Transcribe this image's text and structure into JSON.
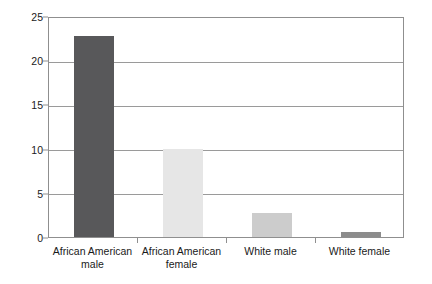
{
  "chart_data": {
    "type": "bar",
    "title": "",
    "subtitle": "",
    "xlabel": "",
    "ylabel": "",
    "categories": [
      "African American male",
      "African American female",
      "White male",
      "White female"
    ],
    "category_lines": [
      [
        "African American",
        "male"
      ],
      [
        "African American",
        "female"
      ],
      [
        "White male",
        ""
      ],
      [
        "White female",
        ""
      ]
    ],
    "values": [
      22.7,
      10.0,
      2.7,
      0.6
    ],
    "bar_colors": [
      "#58585a",
      "#e6e6e6",
      "#cccccc",
      "#8c8c8c"
    ],
    "ylim": [
      0,
      25
    ],
    "yticks": [
      0,
      5,
      10,
      15,
      20,
      25
    ],
    "ytick_labels": [
      "0",
      "5",
      "10",
      "15",
      "20",
      "25"
    ],
    "grid": true,
    "grid_axis": "y",
    "legend": "none",
    "frame": true,
    "background": "#ffffff",
    "grid_color": "#9a9a9a",
    "frame_color": "#8f8f8f",
    "text_color": "#1a1a1a"
  }
}
